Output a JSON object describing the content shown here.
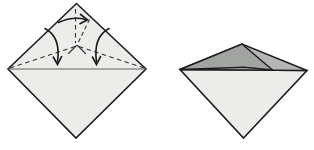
{
  "page": {
    "background": "#ffffff"
  },
  "colors": {
    "paper_light": "#ececea",
    "flap_mid_gray": "#b5b7b5",
    "flap_dark_gray": "#a2a4a2",
    "outline": "#1f1f1f",
    "crease": "#555555",
    "arrow": "#1a1a1a"
  },
  "figures": {
    "step1": {
      "name": "diamond-with-crease-pattern",
      "viewBox": "0 0 157 150",
      "shapes": [
        {
          "name": "paper-outline",
          "d": "M 76.5,3.5 L 146,69 L 76,138 L 8,69 Z",
          "fill": "#ececea",
          "stroke": "#1f1f1f",
          "sw": 1.6,
          "join": "miter"
        },
        {
          "name": "horizontal-crease-line",
          "d": "M 8,69 L 146,69",
          "stroke": "#555555",
          "sw": 0.9
        },
        {
          "name": "valley-fold-left",
          "d": "M 10,68 L 75,46.5",
          "stroke": "#333333",
          "sw": 1.1,
          "dash": "4.5 3.5"
        },
        {
          "name": "valley-fold-right",
          "d": "M 144,68 L 79,46.5",
          "stroke": "#333333",
          "sw": 1.1,
          "dash": "4.5 3.5"
        },
        {
          "name": "valley-fold-vertical",
          "d": "M 75.5,9 L 75.5,43",
          "stroke": "#333333",
          "sw": 1.1,
          "dash": "4.5 3.5"
        },
        {
          "name": "valley-fold-diagonal",
          "d": "M 89.5,19.5 L 78.5,42",
          "stroke": "#333333",
          "sw": 1.1,
          "dash": "4 3"
        },
        {
          "name": "crease-junction-left-arm",
          "d": "M 76.5,45.5 L 68.5,53.5",
          "stroke": "#333333",
          "sw": 1.1,
          "cap": "round"
        },
        {
          "name": "crease-junction-right-arm",
          "d": "M 77.5,45.5 L 85.5,53.5",
          "stroke": "#333333",
          "sw": 1.1,
          "cap": "round"
        },
        {
          "name": "fold-arrow-left-shaft",
          "d": "M 45,28.5 Q 61,37 57.5,61.5",
          "stroke": "#1a1a1a",
          "sw": 1.6,
          "cap": "round"
        },
        {
          "name": "fold-arrow-left-head",
          "d": "M 53,56.5 L 57.5,64.5 L 61.8,56.2",
          "stroke": "#1a1a1a",
          "sw": 1.6,
          "join": "miter"
        },
        {
          "name": "fold-arrow-right-shaft",
          "d": "M 109,28.5 Q 93,37 96.5,61.5",
          "stroke": "#1a1a1a",
          "sw": 1.6,
          "cap": "round"
        },
        {
          "name": "fold-arrow-right-head",
          "d": "M 92.2,56.5 L 96.5,64.5 L 100.8,56.2",
          "stroke": "#1a1a1a",
          "sw": 1.6,
          "join": "miter"
        },
        {
          "name": "turn-arrow-shaft",
          "d": "M 58.5,22.5 Q 73,16 85.5,19.5",
          "stroke": "#1a1a1a",
          "sw": 1.6,
          "cap": "round"
        },
        {
          "name": "turn-arrow-head",
          "d": "M 80,14 L 87.5,19.8 L 79.5,24",
          "stroke": "#1a1a1a",
          "sw": 1.6,
          "join": "miter"
        }
      ]
    },
    "step2": {
      "name": "folded-result-with-overlapping-flaps",
      "viewBox": "157 0 157 150",
      "shapes": [
        {
          "name": "paper-bottom-layer",
          "d": "M 180,69.5 L 307,70.5 L 243.5,138 Z",
          "fill": "#ececea",
          "stroke": "#1f1f1f",
          "sw": 1.6,
          "join": "miter"
        },
        {
          "name": "folded-flap-right",
          "d": "M 180,69.5 L 242,44 L 307,70.5 Z",
          "fill": "#b5b7b5",
          "stroke": "#1f1f1f",
          "sw": 1.6,
          "join": "miter"
        },
        {
          "name": "folded-flap-left",
          "d": "M 180,69.5 L 242,44 L 272.5,70 L 244,67.3 Z",
          "fill": "#a2a4a2",
          "stroke": "#1d1d1d",
          "sw": 1.5,
          "join": "miter"
        }
      ]
    }
  }
}
